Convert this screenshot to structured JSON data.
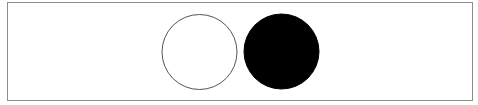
{
  "diagram": {
    "frame": {
      "border_color": "#8c8c8c",
      "background": "#ffffff"
    },
    "shapes": [
      {
        "name": "open-circle",
        "type": "circle",
        "cx": 199.5,
        "cy": 52,
        "r": 37.5,
        "fill": "#ffffff",
        "stroke": "#555555",
        "stroke_width": 1
      },
      {
        "name": "filled-circle",
        "type": "circle",
        "cx": 281.5,
        "cy": 51.5,
        "r": 37.5,
        "fill": "#000000",
        "stroke": "#000000",
        "stroke_width": 1
      }
    ]
  }
}
